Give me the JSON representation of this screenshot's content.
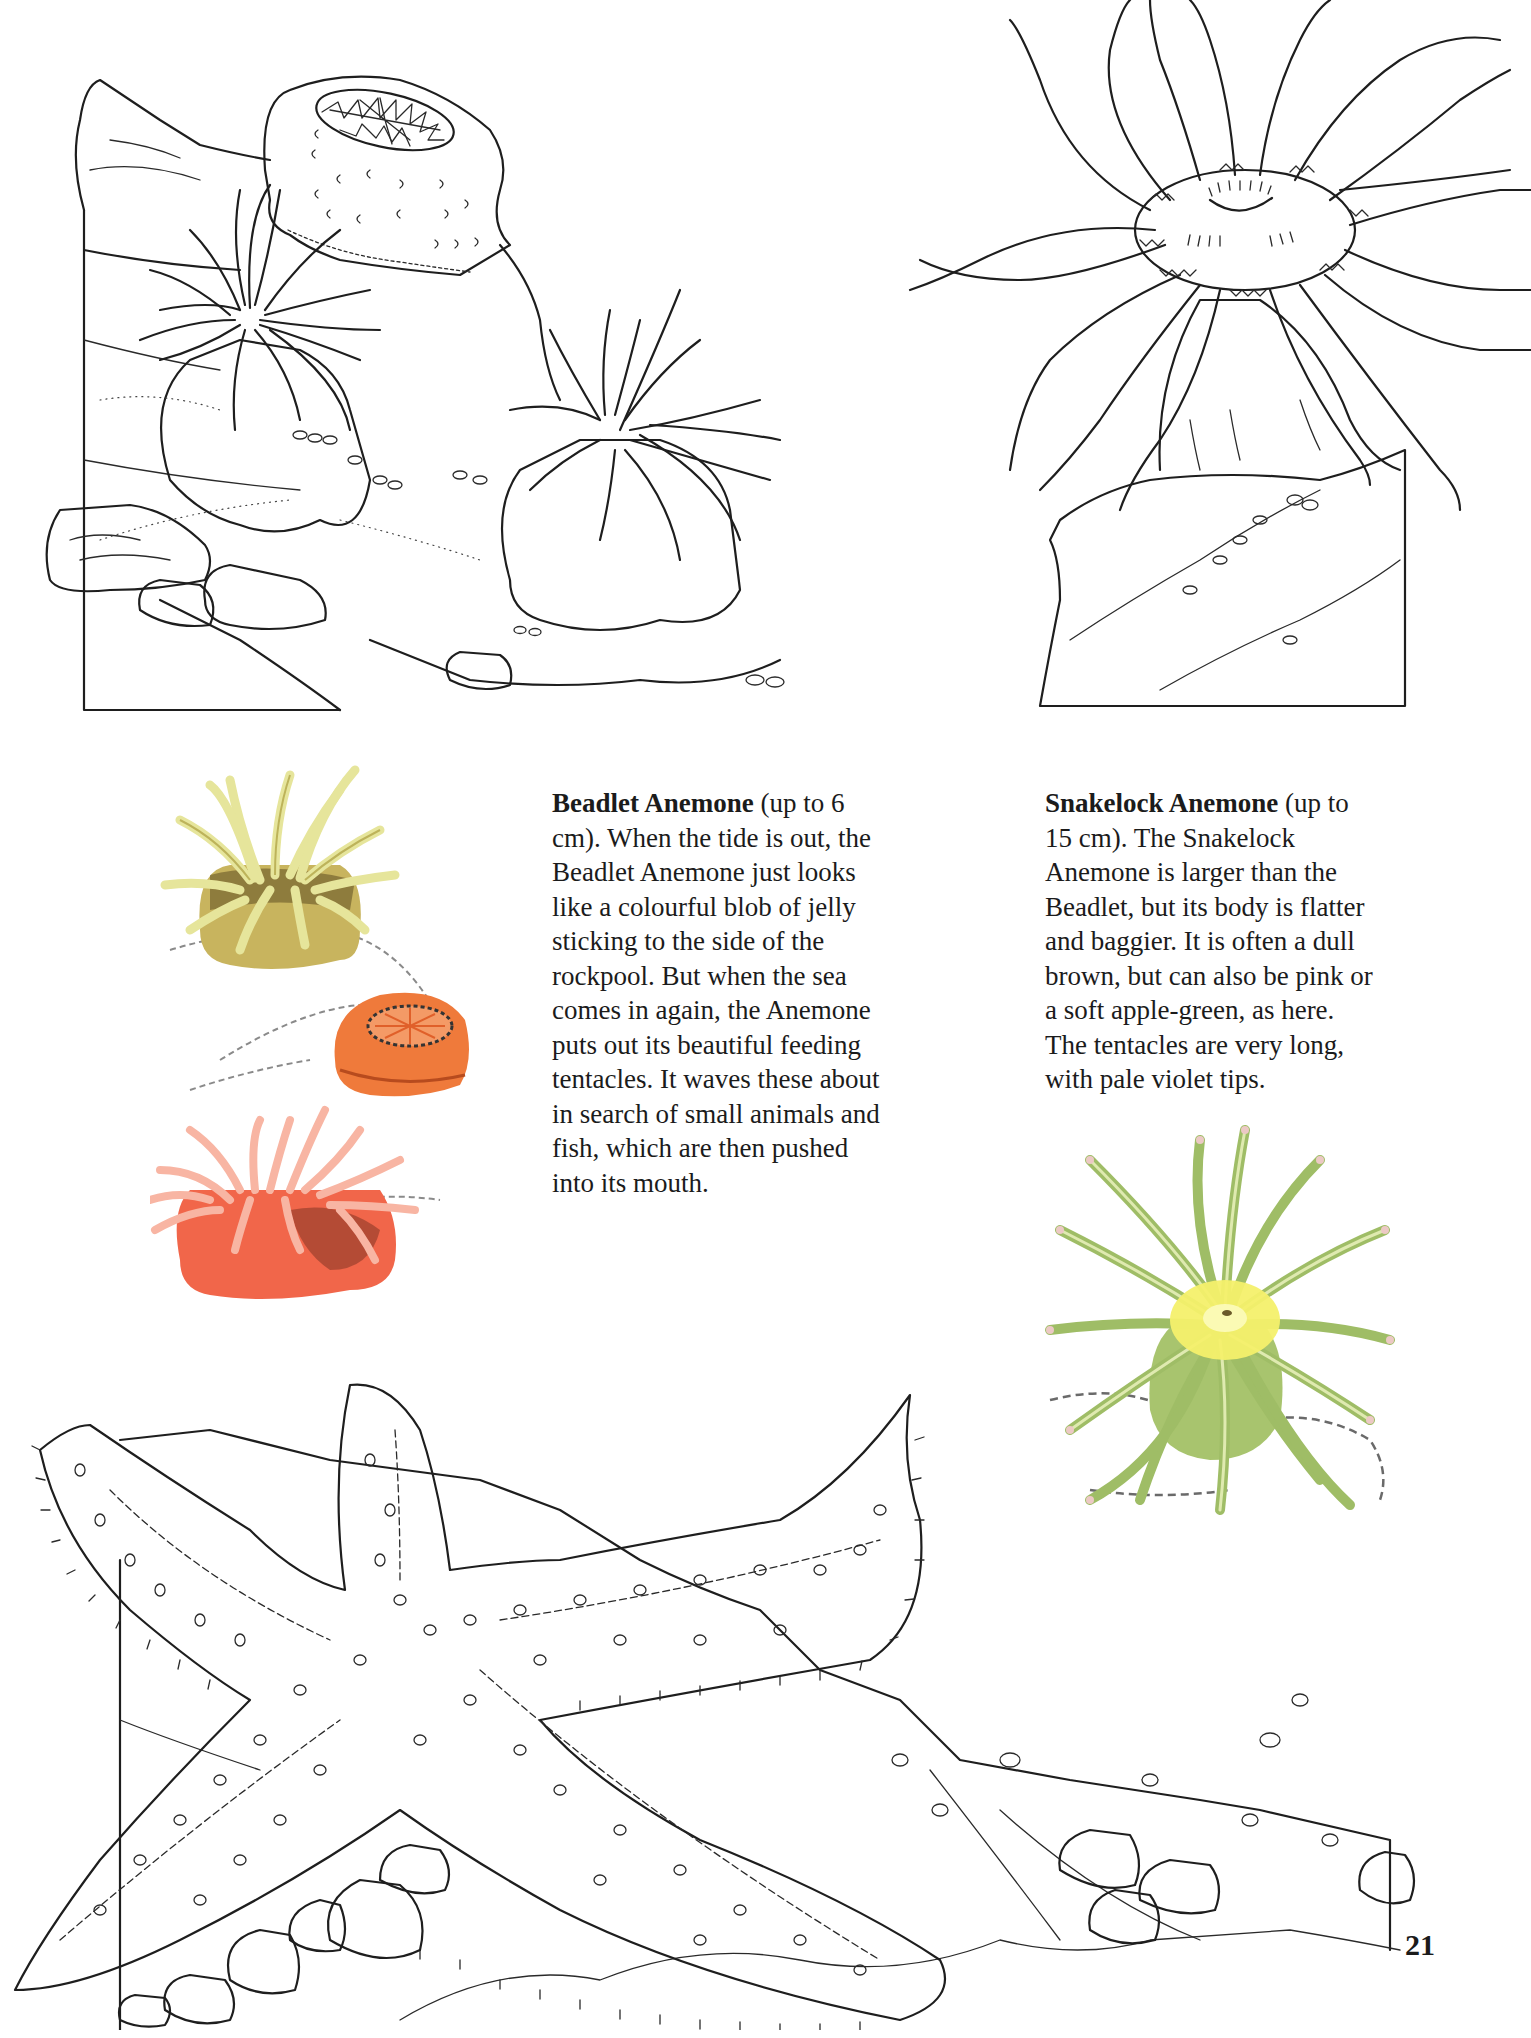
{
  "page": {
    "number": "21",
    "background": "#ffffff"
  },
  "beadlet": {
    "title": "Beadlet Anemone",
    "size": "(up to 6 cm).",
    "body": "When the tide is out, the Beadlet Anemone just looks like a colourful blob of jelly sticking to the side of the rockpool. But when the sea comes in again, the Anemone puts out its beautiful feeding tentacles. It waves these about in search of small animals and fish, which are then pushed into its mouth.",
    "lines": [
      "cm). When the tide is out, the",
      "Beadlet Anemone just looks",
      "like a colourful blob of jelly",
      "sticking to the side of the",
      "rockpool. But when the sea",
      "comes in again, the Anemone",
      "puts out its beautiful feeding",
      "tentacles. It waves these about",
      "in search of small animals and",
      "fish, which are then pushed",
      "into its mouth."
    ],
    "first_line_suffix": "(up to 6",
    "colors": {
      "yellow_tentacles": "#e7e39a",
      "yellow_body": "#c7b25c",
      "closed_orange": "#f07a3a",
      "red_body": "#f2664a",
      "red_tentacles": "#f7b4a2"
    }
  },
  "snakelock": {
    "title": "Snakelock Anemone",
    "first_line_suffix": "(up to",
    "body": "15 cm). The Snakelock Anemone is larger than the Beadlet, but its body is flatter and baggier. It is often a dull brown, but can also be pink or a soft apple-green, as here. The tentacles are very long, with pale violet tips.",
    "lines": [
      "15 cm). The Snakelock",
      "Anemone is larger than the",
      "Beadlet, but its body is flatter",
      "and baggier. It is often a dull",
      "brown, but can also be pink or",
      "a soft apple-green, as here.",
      "The tentacles are very long,",
      "with pale violet tips."
    ],
    "colors": {
      "tentacle_green": "#a9c472",
      "tentacle_light": "#d8e6a6",
      "disc_yellow": "#f3f06a",
      "tip_violet": "#e9c3c3"
    }
  },
  "illustrations": {
    "top_left": "beadlet-anemones-coloring-scene",
    "top_right": "snakelock-anemone-coloring-scene",
    "left_colored": "beadlet-anemones-colored-reference",
    "right_colored": "snakelock-anemone-colored-reference",
    "bottom": "starfish-coloring-scene"
  }
}
